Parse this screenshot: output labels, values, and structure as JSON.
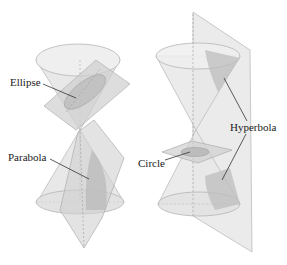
{
  "diagram": {
    "labels": {
      "ellipse": "Ellipse",
      "parabola": "Parabola",
      "circle": "Circle",
      "hyperbola": "Hyperbola"
    },
    "colors": {
      "cone_fill": "#e6e6e6",
      "cone_stroke": "#b8b8b8",
      "plane_fill": "#d4d4d4",
      "section_fill": "#c2c2c2",
      "leader_line": "#333333",
      "axis_dash": "#a0a0a0"
    }
  }
}
